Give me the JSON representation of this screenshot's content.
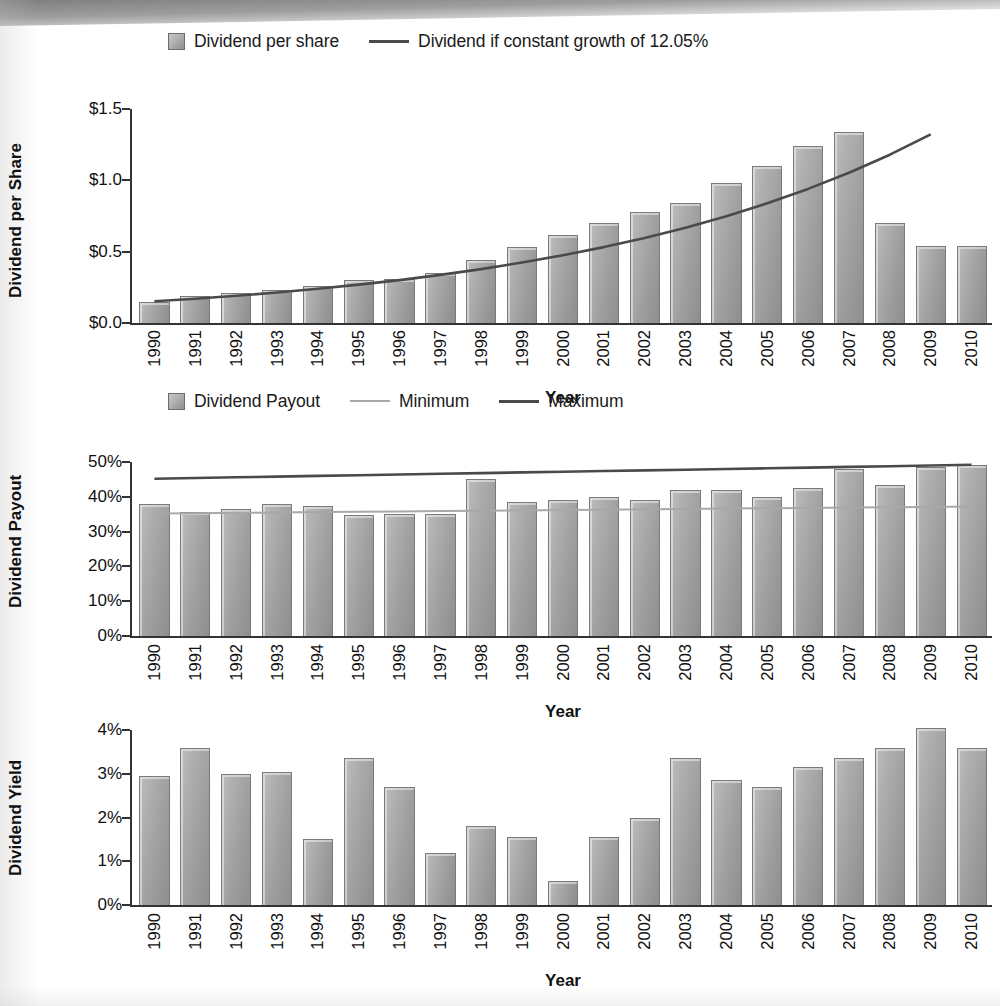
{
  "chart_data": [
    {
      "type": "bar",
      "title": "",
      "xlabel": "Year",
      "ylabel": "Dividend per Share",
      "ylim": [
        0,
        1.5
      ],
      "ytick_labels": [
        "$0.0",
        "$0.5",
        "$1.0",
        "$1.5"
      ],
      "ytick_values": [
        0,
        0.5,
        1.0,
        1.5
      ],
      "grid": false,
      "legend_position": "top",
      "legend": [
        {
          "label": "Dividend per share",
          "marker": "square-swatch",
          "color": "#a0a0a0"
        },
        {
          "label": "Dividend if constant growth of 12.05%",
          "marker": "line",
          "color": "#4a4a4a"
        }
      ],
      "categories": [
        "1990",
        "1991",
        "1992",
        "1993",
        "1994",
        "1995",
        "1996",
        "1997",
        "1998",
        "1999",
        "2000",
        "2001",
        "2002",
        "2003",
        "2004",
        "2005",
        "2006",
        "2007",
        "2008",
        "2009",
        "2010"
      ],
      "series": [
        {
          "name": "Dividend per share",
          "type": "bar",
          "values": [
            0.15,
            0.19,
            0.21,
            0.23,
            0.26,
            0.3,
            0.31,
            0.35,
            0.44,
            0.53,
            0.62,
            0.7,
            0.78,
            0.84,
            0.98,
            1.1,
            1.24,
            1.34,
            0.7,
            0.54
          ]
        },
        {
          "name": "Dividend if constant growth of 12.05%",
          "type": "line",
          "values": [
            0.152,
            0.17,
            0.191,
            0.214,
            0.24,
            0.269,
            0.301,
            0.337,
            0.378,
            0.424,
            0.475,
            0.532,
            0.596,
            0.668,
            0.748,
            0.839,
            0.94,
            1.053,
            1.18,
            1.322
          ]
        }
      ],
      "bar_values_by_year": {
        "1990": 0.15,
        "1991": 0.19,
        "1992": 0.21,
        "1993": 0.23,
        "1994": 0.26,
        "1995": 0.3,
        "1996": 0.31,
        "1997": 0.35,
        "1998": 0.44,
        "1999": 0.53,
        "2000": 0.62,
        "2001": 0.7,
        "2002": 0.78,
        "2003": 0.84,
        "2004": 0.98,
        "2005": 1.1,
        "2006": 1.24,
        "2007": 1.34,
        "2008": 1.34,
        "2009": 0.7,
        "2010": 0.54
      },
      "growth_rate_label": "12.05%"
    },
    {
      "type": "bar",
      "title": "",
      "xlabel": "Year",
      "ylabel": "Dividend Payout",
      "ylim": [
        0,
        50
      ],
      "ytick_labels": [
        "0%",
        "10%",
        "20%",
        "30%",
        "40%",
        "50%"
      ],
      "ytick_values": [
        0,
        10,
        20,
        30,
        40,
        50
      ],
      "grid": false,
      "legend_position": "top",
      "legend": [
        {
          "label": "Dividend Payout",
          "marker": "square-swatch",
          "color": "#a0a0a0"
        },
        {
          "label": "Minimum",
          "marker": "line",
          "color": "#a8a8a8"
        },
        {
          "label": "Maximum",
          "marker": "line",
          "color": "#4a4a4a"
        }
      ],
      "categories": [
        "1990",
        "1991",
        "1992",
        "1993",
        "1994",
        "1995",
        "1996",
        "1997",
        "1998",
        "1999",
        "2000",
        "2001",
        "2002",
        "2003",
        "2004",
        "2005",
        "2006",
        "2007",
        "2008",
        "2009",
        "2010"
      ],
      "series": [
        {
          "name": "Dividend Payout",
          "type": "bar",
          "values": [
            38,
            35.5,
            36.5,
            38,
            37.5,
            34.8,
            35,
            35,
            45,
            38.5,
            39,
            40,
            39,
            42,
            42,
            40,
            42.5,
            48,
            43.5,
            48.5,
            49
          ]
        },
        {
          "name": "Minimum",
          "type": "reference-line",
          "values": [
            35.2,
            35.3,
            35.4,
            35.5,
            35.6,
            35.7,
            35.8,
            35.9,
            36.0,
            36.1,
            36.2,
            36.3,
            36.4,
            36.5,
            36.6,
            36.7,
            36.8,
            36.9,
            37.0,
            37.1,
            37.2
          ]
        },
        {
          "name": "Maximum",
          "type": "reference-line",
          "values": [
            45.2,
            45.4,
            45.6,
            45.8,
            46.0,
            46.2,
            46.4,
            46.6,
            46.8,
            47.0,
            47.2,
            47.4,
            47.6,
            47.8,
            48.0,
            48.2,
            48.4,
            48.6,
            48.8,
            49.0,
            49.2
          ]
        }
      ],
      "bar_values_by_year": {
        "1990": 38,
        "1991": 35.5,
        "1992": 36.5,
        "1993": 38,
        "1994": 37.5,
        "1995": 34.8,
        "1996": 35,
        "1997": 35,
        "1998": 45,
        "1999": 38.5,
        "2000": 39,
        "2001": 40,
        "2002": 39,
        "2003": 42,
        "2004": 42,
        "2005": 40,
        "2006": 42.5,
        "2007": 48,
        "2008": 43.5,
        "2009": 48.5,
        "2010": 49
      }
    },
    {
      "type": "bar",
      "title": "",
      "xlabel": "Year",
      "ylabel": "Dividend Yield",
      "ylim": [
        0,
        4
      ],
      "ytick_labels": [
        "0%",
        "1%",
        "2%",
        "3%",
        "4%"
      ],
      "ytick_values": [
        0,
        1,
        2,
        3,
        4
      ],
      "grid": false,
      "legend_position": "none",
      "legend": [],
      "categories": [
        "1990",
        "1991",
        "1992",
        "1993",
        "1994",
        "1995",
        "1996",
        "1997",
        "1998",
        "1999",
        "2000",
        "2001",
        "2002",
        "2003",
        "2004",
        "2005",
        "2006",
        "2007",
        "2008",
        "2009",
        "2010"
      ],
      "series": [
        {
          "name": "Dividend Yield",
          "type": "bar",
          "values": [
            2.95,
            3.6,
            3.0,
            3.05,
            1.5,
            3.35,
            2.7,
            1.2,
            1.8,
            1.55,
            0.55,
            1.55,
            2.0,
            3.35,
            2.85,
            2.7,
            3.15,
            3.35,
            3.6,
            4.05,
            3.6
          ]
        }
      ],
      "bar_values_by_year": {
        "1990": 2.95,
        "1991": 3.6,
        "1992": 3.0,
        "1993": 3.05,
        "1994": 1.5,
        "1995": 3.35,
        "1996": 2.7,
        "1997": 1.2,
        "1998": 1.8,
        "1999": 1.55,
        "2000": 0.55,
        "2001": 1.55,
        "2002": 2.0,
        "2003": 3.35,
        "2004": 2.85,
        "2005": 2.7,
        "2006": 3.15,
        "2007": 3.35,
        "2008": 3.6,
        "2009": 4.05,
        "2010": 3.6
      }
    }
  ],
  "colors": {
    "bar_fill_light": "#bdbdbd",
    "bar_fill_dark": "#8e8e8e",
    "bar_border": "#7a7a7a",
    "line_dark": "#4a4a4a",
    "line_light": "#a8a8a8",
    "axis": "#333333",
    "text": "#111111",
    "background": "#ffffff"
  }
}
